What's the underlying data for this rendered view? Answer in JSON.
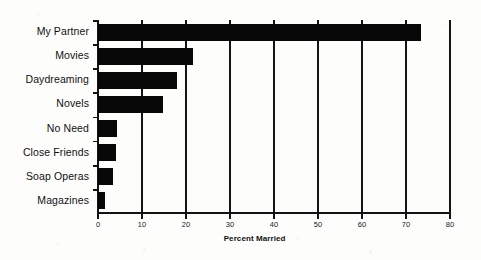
{
  "chart_data": {
    "type": "bar",
    "orientation": "horizontal",
    "title": "",
    "xlabel": "Percent Married",
    "ylabel": "",
    "categories": [
      "My Partner",
      "Movies",
      "Daydreaming",
      "Novels",
      "No Need",
      "Close Friends",
      "Soap Operas",
      "Magazines"
    ],
    "values": [
      73.5,
      21.5,
      18.0,
      14.7,
      4.3,
      4.0,
      3.4,
      1.7
    ],
    "xlim": [
      0,
      80
    ],
    "xticks": [
      0,
      10,
      20,
      30,
      40,
      50,
      60,
      70,
      80
    ],
    "xtick_labels": [
      "0",
      "10",
      "20",
      "30",
      "40",
      "50",
      "60",
      "70",
      "80"
    ],
    "grid": "vertical",
    "legend": "none",
    "bar_color": "#080808",
    "axis_color": "#121212",
    "background_color": "#fdfdfc"
  },
  "axis": {
    "x_label": "Percent Married"
  }
}
